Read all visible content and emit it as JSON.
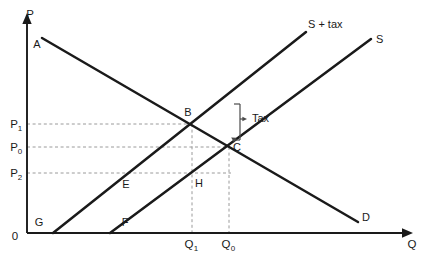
{
  "figure": {
    "background_color": "#ffffff",
    "line_color": "#1a1a1a",
    "dashed_color": "#9a9a9a"
  },
  "axes": {
    "vertical_label": "P",
    "horizontal_label": "Q",
    "origin_label": "0"
  },
  "price_ticks": [
    {
      "base": "P",
      "sub": "1",
      "y": 124
    },
    {
      "base": "P",
      "sub": "0",
      "y": 147
    },
    {
      "base": "P",
      "sub": "2",
      "y": 173
    }
  ],
  "quantity_ticks": [
    {
      "base": "Q",
      "sub": "1",
      "x": 192
    },
    {
      "base": "Q",
      "sub": "0",
      "x": 229
    }
  ],
  "curves": [
    {
      "name": "demand",
      "label": "D"
    },
    {
      "name": "supply",
      "label": "S"
    },
    {
      "name": "supply-plus-tax",
      "label": "S + tax"
    }
  ],
  "points": [
    {
      "id": "A",
      "label": "A",
      "x": 37,
      "y": 48
    },
    {
      "id": "B",
      "label": "B",
      "x": 188,
      "y": 116
    },
    {
      "id": "C",
      "label": "C",
      "x": 237,
      "y": 151
    },
    {
      "id": "D",
      "label": "D",
      "x": 362,
      "y": 221
    },
    {
      "id": "E",
      "label": "E",
      "x": 126,
      "y": 188
    },
    {
      "id": "F",
      "label": "F",
      "x": 123,
      "y": 226
    },
    {
      "id": "G",
      "label": "G",
      "x": 39,
      "y": 226
    },
    {
      "id": "H",
      "label": "H",
      "x": 197,
      "y": 187
    }
  ],
  "annotations": [
    {
      "id": "tax-bracket",
      "label": "Tax"
    }
  ],
  "curve_labels": {
    "demand": "D",
    "supply": "S",
    "supply_tax": "S + tax"
  }
}
